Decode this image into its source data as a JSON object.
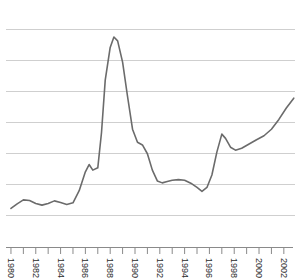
{
  "chart_data": {
    "type": "line",
    "title": "",
    "subtitle": "",
    "xlabel": "",
    "ylabel": "",
    "grid": true,
    "gridlines": 7,
    "legend": "none",
    "xlim": [
      1979.6,
      2002.9
    ],
    "ylim": [
      0,
      7
    ],
    "xtick_labels": [
      "1980",
      "1982",
      "1984",
      "1986",
      "1988",
      "1990",
      "1992",
      "1994",
      "1996",
      "1998",
      "2000",
      "2002"
    ],
    "xtick_values": [
      1980,
      1982,
      1984,
      1986,
      1988,
      1990,
      1992,
      1994,
      1996,
      1998,
      2000,
      2002
    ],
    "xtick_minor_values": [
      1981,
      1983,
      1985,
      1987,
      1989,
      1991,
      1993,
      1995,
      1997,
      1999,
      2001
    ],
    "ytick_labels": [],
    "series": [
      {
        "name": "series-1",
        "color": "#6b6b6b",
        "x": [
          1980.0,
          1980.5,
          1981.0,
          1981.5,
          1982.0,
          1982.5,
          1983.0,
          1983.5,
          1984.0,
          1984.5,
          1985.0,
          1985.5,
          1986.0,
          1986.3,
          1986.6,
          1987.0,
          1987.3,
          1987.6,
          1988.0,
          1988.3,
          1988.6,
          1989.0,
          1989.4,
          1989.8,
          1990.2,
          1990.6,
          1991.0,
          1991.4,
          1991.8,
          1992.2,
          1992.6,
          1993.0,
          1993.5,
          1994.0,
          1994.5,
          1995.0,
          1995.4,
          1995.8,
          1996.2,
          1996.6,
          1997.0,
          1997.3,
          1997.7,
          1998.1,
          1998.6,
          1999.2,
          1999.8,
          2000.4,
          2001.0,
          2001.6,
          2002.2,
          2002.8
        ],
        "y": [
          1.18,
          1.32,
          1.44,
          1.42,
          1.33,
          1.28,
          1.33,
          1.41,
          1.36,
          1.3,
          1.35,
          1.72,
          2.3,
          2.52,
          2.35,
          2.42,
          3.5,
          5.1,
          6.1,
          6.42,
          6.3,
          5.65,
          4.6,
          3.6,
          3.2,
          3.12,
          2.85,
          2.35,
          2.02,
          1.96,
          2.0,
          2.04,
          2.06,
          2.04,
          1.95,
          1.82,
          1.7,
          1.82,
          2.2,
          2.9,
          3.45,
          3.32,
          3.05,
          2.96,
          3.02,
          3.15,
          3.28,
          3.4,
          3.6,
          3.9,
          4.25,
          4.55
        ]
      }
    ],
    "annotations": []
  },
  "axis": {
    "x_axis_name": "x-axis",
    "tick_count": 23
  },
  "colors": {
    "background": "#ffffff",
    "gridline": "#cfcfcf",
    "axis": "#8a8a8a",
    "line": "#6b6b6b",
    "tick_text": "#2b2b2b"
  }
}
